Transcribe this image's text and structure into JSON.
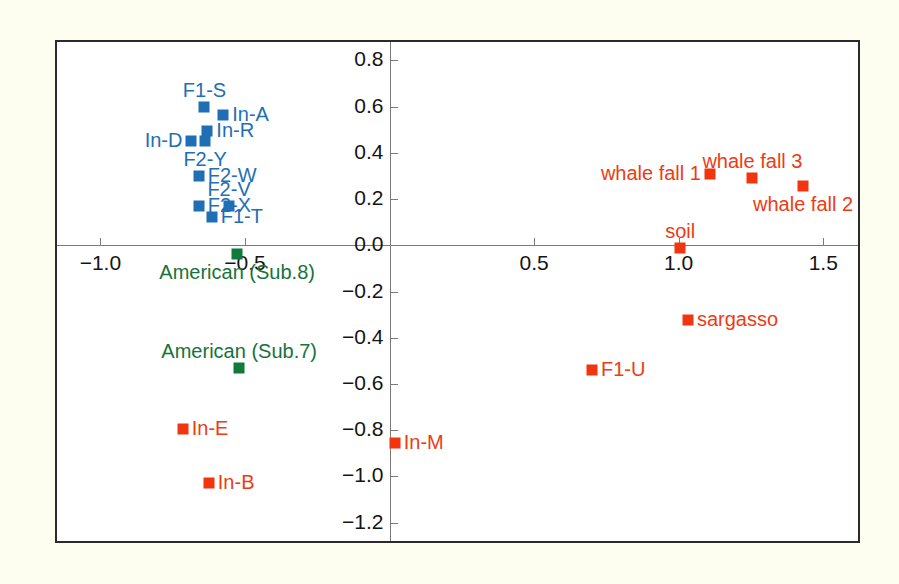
{
  "figure": {
    "background_color": "#fdfdf0",
    "plot_background_color": "#ffffff",
    "frame_color": "#2b2b2b",
    "axis_color": "#7a7a7a"
  },
  "colors": {
    "blue": "#1f6fb5",
    "red": "#f0350f",
    "green": "#0e7a3c",
    "text": "#141414"
  },
  "chart_data": {
    "type": "scatter",
    "title": "",
    "xlabel": "",
    "ylabel": "",
    "xlim": [
      -1.15,
      1.62
    ],
    "ylim": [
      -1.28,
      0.88
    ],
    "grid": false,
    "legend": "none",
    "xticks": [
      -1.0,
      -0.5,
      0.5,
      1.0,
      1.5
    ],
    "xticklabels": [
      "−1.0",
      "−0.5",
      "0.5",
      "1.0",
      "1.5"
    ],
    "yticks": [
      0.8,
      0.6,
      0.4,
      0.2,
      0.0,
      -0.2,
      -0.4,
      -0.6,
      -0.8,
      -1.0,
      -1.2
    ],
    "yticklabels": [
      "0.8",
      "0.6",
      "0.4",
      "0.2",
      "0.0",
      "−0.2",
      "−0.4",
      "−0.6",
      "−0.8",
      "−1.0",
      "−1.2"
    ],
    "groups": [
      {
        "name": "blue-cluster",
        "color": "#1f6fb5",
        "points": [
          {
            "label": "F1-S",
            "x": -0.64,
            "y": 0.6,
            "label_pos": "top"
          },
          {
            "label": "In-A",
            "x": -0.575,
            "y": 0.565,
            "label_pos": "right"
          },
          {
            "label": "In-R",
            "x": -0.63,
            "y": 0.493,
            "label_pos": "right"
          },
          {
            "label": "In-D",
            "x": -0.685,
            "y": 0.452,
            "label_pos": "left"
          },
          {
            "label": "F2-Y",
            "x": -0.638,
            "y": 0.45,
            "label_pos": "bottom"
          },
          {
            "label": "F2-W",
            "x": -0.66,
            "y": 0.3,
            "label_pos": "right"
          },
          {
            "label": "F2-X",
            "x": -0.66,
            "y": 0.17,
            "label_pos": "right"
          },
          {
            "label": "F2-V",
            "x": -0.555,
            "y": 0.168,
            "label_pos": "top"
          },
          {
            "label": "F1-T",
            "x": -0.615,
            "y": 0.122,
            "label_pos": "right"
          }
        ]
      },
      {
        "name": "green-cluster",
        "color": "#0e7a3c",
        "points": [
          {
            "label": "American (Sub.8)",
            "x": -0.527,
            "y": -0.038,
            "label_pos": "bottom"
          },
          {
            "label": "American (Sub.7)",
            "x": -0.52,
            "y": -0.53,
            "label_pos": "top"
          }
        ]
      },
      {
        "name": "red-cluster",
        "color": "#f0350f",
        "points": [
          {
            "label": "whale fall 1",
            "x": 1.108,
            "y": 0.308,
            "label_pos": "left"
          },
          {
            "label": "whale fall 3",
            "x": 1.255,
            "y": 0.292,
            "label_pos": "top"
          },
          {
            "label": "whale fall 2",
            "x": 1.43,
            "y": 0.255,
            "label_pos": "bottom"
          },
          {
            "label": "soil",
            "x": 1.005,
            "y": -0.01,
            "label_pos": "top"
          },
          {
            "label": "sargasso",
            "x": 1.032,
            "y": -0.325,
            "label_pos": "right"
          },
          {
            "label": "F1-U",
            "x": 0.7,
            "y": -0.54,
            "label_pos": "right"
          },
          {
            "label": "In-M",
            "x": 0.018,
            "y": -0.855,
            "label_pos": "right"
          },
          {
            "label": "In-E",
            "x": -0.715,
            "y": -0.795,
            "label_pos": "right"
          },
          {
            "label": "In-B",
            "x": -0.625,
            "y": -1.03,
            "label_pos": "right"
          }
        ]
      }
    ]
  }
}
